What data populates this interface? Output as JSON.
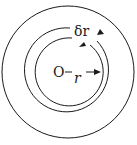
{
  "diagram": {
    "labels": {
      "center": "O",
      "radius": "r",
      "shell_thickness": "δr"
    },
    "colors": {
      "stroke": "#1a1a1a",
      "background": "#ffffff"
    }
  }
}
